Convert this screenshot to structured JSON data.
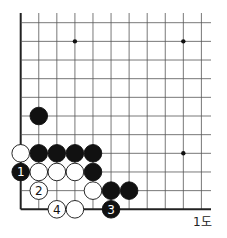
{
  "diagram": {
    "caption": "1도",
    "grid": {
      "x0": 20.7,
      "dx": 18.07,
      "cols": 11,
      "y0": 22.7,
      "dy": 18.66,
      "rows": 11,
      "top_extend": 13,
      "right_extend": 211,
      "line_color": "#555555",
      "edge_color": "#222222"
    },
    "star_points": [
      [
        3,
        1
      ],
      [
        9,
        1
      ],
      [
        9,
        7
      ]
    ],
    "stones": [
      {
        "color": "black",
        "col": 1,
        "row": 5,
        "label": ""
      },
      {
        "color": "white",
        "col": 0,
        "row": 7,
        "label": ""
      },
      {
        "color": "black",
        "col": 1,
        "row": 7,
        "label": ""
      },
      {
        "color": "black",
        "col": 2,
        "row": 7,
        "label": ""
      },
      {
        "color": "black",
        "col": 3,
        "row": 7,
        "label": ""
      },
      {
        "color": "black",
        "col": 4,
        "row": 7,
        "label": ""
      },
      {
        "color": "black",
        "col": 0,
        "row": 8,
        "label": "1"
      },
      {
        "color": "white",
        "col": 1,
        "row": 8,
        "label": ""
      },
      {
        "color": "white",
        "col": 2,
        "row": 8,
        "label": ""
      },
      {
        "color": "white",
        "col": 3,
        "row": 8,
        "label": ""
      },
      {
        "color": "black",
        "col": 4,
        "row": 8,
        "label": ""
      },
      {
        "color": "white",
        "col": 1,
        "row": 9,
        "label": "2"
      },
      {
        "color": "white",
        "col": 4,
        "row": 9,
        "label": ""
      },
      {
        "color": "black",
        "col": 5,
        "row": 9,
        "label": ""
      },
      {
        "color": "black",
        "col": 6,
        "row": 9,
        "label": ""
      },
      {
        "color": "white",
        "col": 2,
        "row": 10,
        "label": "4"
      },
      {
        "color": "white",
        "col": 3,
        "row": 10,
        "label": ""
      },
      {
        "color": "black",
        "col": 5,
        "row": 10,
        "label": "3"
      }
    ]
  }
}
